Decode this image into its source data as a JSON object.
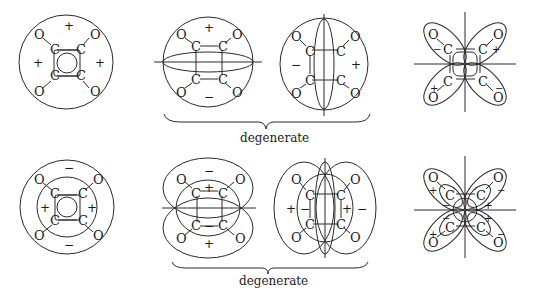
{
  "figure": {
    "atoms": {
      "carbon": "C",
      "oxygen": "O"
    },
    "signs": {
      "plus": "+",
      "minus": "−"
    },
    "row1": {
      "panels": [
        {
          "name": "totally-symmetric",
          "signs": [
            "+",
            "+",
            "+"
          ]
        },
        {
          "name": "degenerate-a-horizontal-node",
          "signs": [
            "+",
            "−"
          ]
        },
        {
          "name": "degenerate-b-vertical-node",
          "signs": [
            "−",
            "+"
          ]
        },
        {
          "name": "four-lobe",
          "signs": [
            "−",
            "+",
            "+",
            "−"
          ]
        }
      ],
      "brace_label": "degenerate"
    },
    "row2": {
      "panels": [
        {
          "name": "concentric-ring",
          "signs": [
            "−",
            "+",
            "+",
            "−"
          ]
        },
        {
          "name": "degenerate-a-horizontal-node",
          "signs": [
            "−",
            "+",
            "−",
            "+"
          ]
        },
        {
          "name": "degenerate-b-vertical-node",
          "signs": [
            "+",
            "−",
            "+",
            "−"
          ]
        },
        {
          "name": "four-lobe-with-inner",
          "signs": [
            "+",
            "−",
            "−",
            "+",
            "−",
            "+",
            "+",
            "−"
          ]
        }
      ],
      "brace_label": "degenerate"
    }
  }
}
